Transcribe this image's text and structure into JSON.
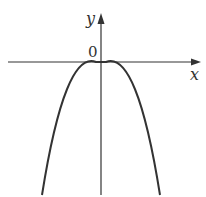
{
  "diagram": {
    "type": "function-graph",
    "axes": {
      "x_label": "x",
      "y_label": "y",
      "origin_label": "0"
    },
    "curve": {
      "shape": "parabola",
      "opens": "down",
      "vertex": [
        0,
        0
      ]
    },
    "colors": {
      "stroke": "#333333",
      "background": "#ffffff"
    }
  }
}
